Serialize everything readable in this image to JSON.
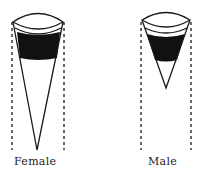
{
  "figure": {
    "cones": [
      {
        "label": "Female",
        "left_x": 12,
        "right_x": 64,
        "top_y": 20,
        "band_top": 31,
        "band_bottom": 58,
        "apex_x": 37,
        "apex_y": 150,
        "guide_bottom": 150
      },
      {
        "label": "Male",
        "left_x": 141,
        "right_x": 191,
        "top_y": 20,
        "band_top": 33,
        "band_bottom": 60,
        "apex_x": 166,
        "apex_y": 88,
        "guide_bottom": 150
      }
    ],
    "colors": {
      "ink": "#1a1a1a",
      "fill": "#111111",
      "background": "#ffffff"
    }
  }
}
